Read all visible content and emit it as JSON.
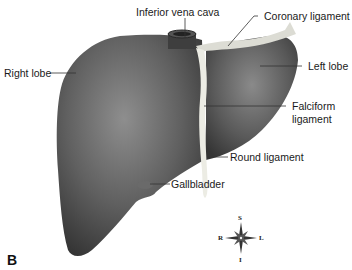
{
  "figure": {
    "panel_label": "B",
    "labels": {
      "ivc": "Inferior vena cava",
      "coronary": "Coronary ligament",
      "right_lobe": "Right lobe",
      "left_lobe": "Left lobe",
      "falciform_1": "Falciform",
      "falciform_2": "ligament",
      "round": "Round ligament",
      "gallbladder": "Gallbladder"
    },
    "compass": {
      "s": "S",
      "i": "I",
      "r": "R",
      "l": "L"
    },
    "colors": {
      "liver_dark": "#3a3a3a",
      "liver_light": "#8a8a8a",
      "ligament": "#e8e8e0",
      "line": "#333333"
    }
  }
}
